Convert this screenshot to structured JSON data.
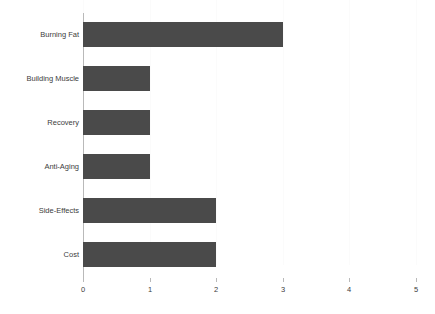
{
  "chart_data": {
    "type": "bar",
    "orientation": "horizontal",
    "title": "",
    "subtitle": "",
    "xlabel": "",
    "ylabel": "",
    "categories": [
      "Burning Fat",
      "Building Muscle",
      "Recovery",
      "Anti-Aging",
      "Side-Effects",
      "Cost"
    ],
    "values": [
      3,
      1,
      1,
      1,
      2,
      2
    ],
    "xlim": [
      0,
      5
    ],
    "xticks": [
      0,
      1,
      2,
      3,
      4,
      5
    ],
    "xtick_labels": [
      "0",
      "1",
      "2",
      "3",
      "4",
      "5"
    ],
    "ytick_labels": [
      "Burning Fat",
      "Building Muscle",
      "Recovery",
      "Anti-Aging",
      "Side-Effects",
      "Cost"
    ],
    "grid": true,
    "grid_axis": "x",
    "legend": false,
    "legend_position": "none",
    "annotations": [],
    "data_labels": false
  },
  "style": {
    "background_color": "#ffffff",
    "bar_color": "#4a4a4a",
    "axis_color": "#b9b9b9",
    "gridline_color": "#fbfbfb",
    "text_color": "#3c3c3c"
  }
}
